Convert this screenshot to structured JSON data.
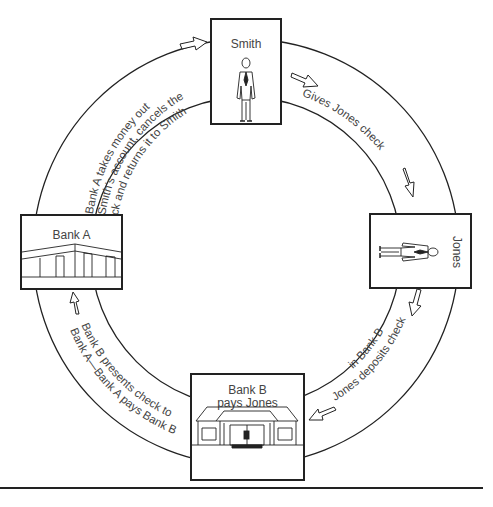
{
  "diagram": {
    "type": "cycle",
    "nodes": [
      {
        "id": "smith",
        "label": "Smith",
        "figure": "standing-man"
      },
      {
        "id": "jones",
        "label": "Jones",
        "figure": "lying-man"
      },
      {
        "id": "bank_b",
        "label_line1": "Bank B",
        "label_line2": "pays Jones",
        "figure": "bank-building"
      },
      {
        "id": "bank_a",
        "label": "Bank A",
        "figure": "bank-building"
      }
    ],
    "steps": [
      {
        "from": "smith",
        "to": "jones",
        "text": "Gives Jones check"
      },
      {
        "from": "jones",
        "to": "bank_b",
        "text_line1": "Jones deposits check",
        "text_line2": "in Bank B"
      },
      {
        "from": "bank_b",
        "to": "bank_a",
        "text_line1": "Bank B presents check to",
        "text_line2": "Bank A—Bank A pays Bank B"
      },
      {
        "from": "bank_a",
        "to": "smith",
        "text_line1": "Bank A takes money out",
        "text_line2": "of Smith’s account, cancels the",
        "text_line3": "check and returns it to Smith"
      }
    ],
    "colors": {
      "line": "#222222",
      "text": "#444444",
      "background": "#ffffff"
    }
  }
}
